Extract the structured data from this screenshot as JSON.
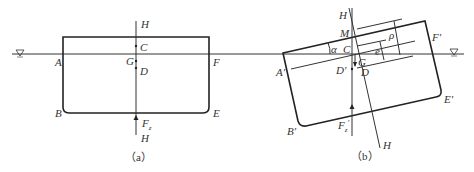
{
  "figure_a": {
    "caption": "（a）",
    "labels": {
      "H_top": "H",
      "C": "C",
      "G": "G",
      "D": "D",
      "A": "A",
      "F": "F",
      "B": "B",
      "E": "E",
      "Fz": "F",
      "Fz_sub": "z",
      "H_bottom": "H"
    }
  },
  "figure_b": {
    "caption": "（b）",
    "labels": {
      "H_top": "H",
      "M": "M",
      "alpha": "α",
      "C": "C",
      "G": "G",
      "D_prime": "D′",
      "D": "D",
      "A_prime": "A′",
      "F_prime": "F′",
      "B_prime": "B′",
      "E_prime": "E′",
      "Fz_prime": "F",
      "Fz_prime_sub": "z",
      "Fz_prime_mark": "′",
      "rho": "ρ",
      "e": "e",
      "H_bottom": "H"
    }
  },
  "water_symbol": "∇"
}
